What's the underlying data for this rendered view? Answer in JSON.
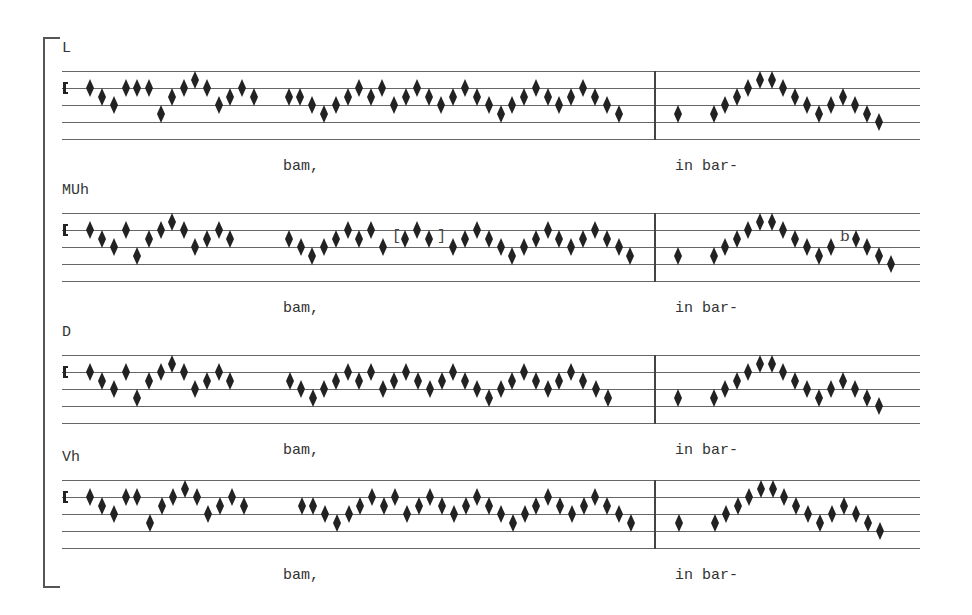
{
  "voices": [
    {
      "label": "L",
      "top": 40,
      "lyrics": [
        {
          "text": "bam,",
          "x": 283
        },
        {
          "text": "in bar-",
          "x": 675
        }
      ],
      "notes": [
        [
          90,
          2
        ],
        [
          102,
          3
        ],
        [
          114,
          4
        ],
        [
          126,
          2
        ],
        [
          137,
          2
        ],
        [
          149,
          2
        ],
        [
          161,
          5
        ],
        [
          172,
          3
        ],
        [
          184,
          2
        ],
        [
          195,
          1
        ],
        [
          207,
          2
        ],
        [
          219,
          4
        ],
        [
          230,
          3
        ],
        [
          242,
          2
        ],
        [
          254,
          3
        ],
        [
          289,
          3
        ],
        [
          300,
          3
        ],
        [
          312,
          4
        ],
        [
          324,
          5
        ],
        [
          336,
          4
        ],
        [
          348,
          3
        ],
        [
          359,
          2
        ],
        [
          371,
          3
        ],
        [
          382,
          2
        ],
        [
          394,
          4
        ],
        [
          406,
          3
        ],
        [
          417,
          2
        ],
        [
          429,
          3
        ],
        [
          441,
          4
        ],
        [
          453,
          3
        ],
        [
          465,
          2
        ],
        [
          477,
          3
        ],
        [
          489,
          4
        ],
        [
          501,
          5
        ],
        [
          512,
          4
        ],
        [
          524,
          3
        ],
        [
          536,
          2
        ],
        [
          548,
          3
        ],
        [
          559,
          4
        ],
        [
          571,
          3
        ],
        [
          583,
          2
        ],
        [
          595,
          3
        ],
        [
          607,
          4
        ],
        [
          619,
          5
        ],
        [
          678,
          5
        ],
        [
          714,
          5
        ],
        [
          725,
          4
        ],
        [
          737,
          3
        ],
        [
          748,
          2
        ],
        [
          760,
          1
        ],
        [
          772,
          1
        ],
        [
          783,
          2
        ],
        [
          795,
          3
        ],
        [
          807,
          4
        ],
        [
          819,
          5
        ],
        [
          831,
          4
        ],
        [
          843,
          3
        ],
        [
          855,
          4
        ],
        [
          867,
          5
        ],
        [
          879,
          6
        ]
      ],
      "editorial": [],
      "flat": null
    },
    {
      "label": "MUh",
      "top": 182,
      "lyrics": [
        {
          "text": "bam,",
          "x": 283
        },
        {
          "text": "in bar-",
          "x": 675
        }
      ],
      "notes": [
        [
          90,
          2
        ],
        [
          102,
          3
        ],
        [
          114,
          4
        ],
        [
          126,
          2
        ],
        [
          137,
          5
        ],
        [
          149,
          3
        ],
        [
          161,
          2
        ],
        [
          172,
          1
        ],
        [
          184,
          2
        ],
        [
          195,
          4
        ],
        [
          207,
          3
        ],
        [
          219,
          2
        ],
        [
          230,
          3
        ],
        [
          289,
          3
        ],
        [
          301,
          4
        ],
        [
          312,
          5
        ],
        [
          324,
          4
        ],
        [
          336,
          3
        ],
        [
          348,
          2
        ],
        [
          359,
          3
        ],
        [
          371,
          2
        ],
        [
          383,
          4
        ],
        [
          405,
          3
        ],
        [
          417,
          2
        ],
        [
          429,
          3
        ],
        [
          453,
          4
        ],
        [
          465,
          3
        ],
        [
          477,
          2
        ],
        [
          489,
          3
        ],
        [
          501,
          4
        ],
        [
          512,
          5
        ],
        [
          524,
          4
        ],
        [
          536,
          3
        ],
        [
          548,
          2
        ],
        [
          559,
          3
        ],
        [
          571,
          4
        ],
        [
          583,
          3
        ],
        [
          595,
          2
        ],
        [
          607,
          3
        ],
        [
          619,
          4
        ],
        [
          630,
          5
        ],
        [
          678,
          5
        ],
        [
          714,
          5
        ],
        [
          725,
          4
        ],
        [
          737,
          3
        ],
        [
          748,
          2
        ],
        [
          760,
          1
        ],
        [
          772,
          1
        ],
        [
          783,
          2
        ],
        [
          795,
          3
        ],
        [
          807,
          4
        ],
        [
          819,
          5
        ],
        [
          831,
          4
        ],
        [
          856,
          3
        ],
        [
          867,
          4
        ],
        [
          879,
          5
        ],
        [
          891,
          6
        ]
      ],
      "editorial": [
        {
          "text": "[",
          "x": 392
        },
        {
          "text": "]",
          "x": 437
        }
      ],
      "flat": {
        "glyph": "b",
        "x": 840,
        "step": 3
      }
    },
    {
      "label": "D",
      "top": 324,
      "lyrics": [
        {
          "text": "bam,",
          "x": 283
        },
        {
          "text": "in bar-",
          "x": 675
        }
      ],
      "notes": [
        [
          90,
          2
        ],
        [
          102,
          3
        ],
        [
          114,
          4
        ],
        [
          126,
          2
        ],
        [
          137,
          5
        ],
        [
          149,
          3
        ],
        [
          161,
          2
        ],
        [
          172,
          1
        ],
        [
          184,
          2
        ],
        [
          195,
          4
        ],
        [
          207,
          3
        ],
        [
          219,
          2
        ],
        [
          230,
          3
        ],
        [
          290,
          3
        ],
        [
          301,
          4
        ],
        [
          313,
          5
        ],
        [
          324,
          4
        ],
        [
          336,
          3
        ],
        [
          348,
          2
        ],
        [
          359,
          3
        ],
        [
          371,
          2
        ],
        [
          383,
          4
        ],
        [
          394,
          3
        ],
        [
          406,
          2
        ],
        [
          418,
          3
        ],
        [
          430,
          4
        ],
        [
          442,
          3
        ],
        [
          453,
          2
        ],
        [
          465,
          3
        ],
        [
          477,
          4
        ],
        [
          489,
          5
        ],
        [
          501,
          4
        ],
        [
          512,
          3
        ],
        [
          524,
          2
        ],
        [
          536,
          3
        ],
        [
          548,
          4
        ],
        [
          559,
          3
        ],
        [
          571,
          2
        ],
        [
          583,
          3
        ],
        [
          596,
          4
        ],
        [
          608,
          5
        ],
        [
          678,
          5
        ],
        [
          714,
          5
        ],
        [
          725,
          4
        ],
        [
          737,
          3
        ],
        [
          748,
          2
        ],
        [
          760,
          1
        ],
        [
          772,
          1
        ],
        [
          783,
          2
        ],
        [
          795,
          3
        ],
        [
          807,
          4
        ],
        [
          819,
          5
        ],
        [
          831,
          4
        ],
        [
          843,
          3
        ],
        [
          855,
          4
        ],
        [
          867,
          5
        ],
        [
          879,
          6
        ]
      ],
      "editorial": [],
      "flat": null
    },
    {
      "label": "Vh",
      "top": 449,
      "lyrics": [
        {
          "text": "bam,",
          "x": 283
        },
        {
          "text": "in bar-",
          "x": 675
        }
      ],
      "notes": [
        [
          90,
          2
        ],
        [
          102,
          3
        ],
        [
          114,
          4
        ],
        [
          126,
          2
        ],
        [
          137,
          2
        ],
        [
          150,
          5
        ],
        [
          162,
          3
        ],
        [
          173,
          2
        ],
        [
          185,
          1
        ],
        [
          197,
          2
        ],
        [
          208,
          4
        ],
        [
          220,
          3
        ],
        [
          232,
          2
        ],
        [
          244,
          3
        ],
        [
          302,
          3
        ],
        [
          313,
          3
        ],
        [
          325,
          4
        ],
        [
          337,
          5
        ],
        [
          349,
          4
        ],
        [
          360,
          3
        ],
        [
          372,
          2
        ],
        [
          384,
          3
        ],
        [
          395,
          2
        ],
        [
          407,
          4
        ],
        [
          419,
          3
        ],
        [
          430,
          2
        ],
        [
          442,
          3
        ],
        [
          454,
          4
        ],
        [
          466,
          3
        ],
        [
          477,
          2
        ],
        [
          489,
          3
        ],
        [
          501,
          4
        ],
        [
          513,
          5
        ],
        [
          525,
          4
        ],
        [
          536,
          3
        ],
        [
          548,
          2
        ],
        [
          560,
          3
        ],
        [
          572,
          4
        ],
        [
          584,
          3
        ],
        [
          595,
          2
        ],
        [
          607,
          3
        ],
        [
          619,
          4
        ],
        [
          631,
          5
        ],
        [
          679,
          5
        ],
        [
          715,
          5
        ],
        [
          726,
          4
        ],
        [
          738,
          3
        ],
        [
          749,
          2
        ],
        [
          761,
          1
        ],
        [
          773,
          1
        ],
        [
          784,
          2
        ],
        [
          796,
          3
        ],
        [
          808,
          4
        ],
        [
          820,
          5
        ],
        [
          832,
          4
        ],
        [
          844,
          3
        ],
        [
          856,
          4
        ],
        [
          868,
          5
        ],
        [
          880,
          6
        ]
      ],
      "editorial": [],
      "flat": null
    }
  ],
  "layout": {
    "staff_offset": 31,
    "line_spacing": 17,
    "lyric_offset": 118,
    "note_color": "#222222"
  }
}
